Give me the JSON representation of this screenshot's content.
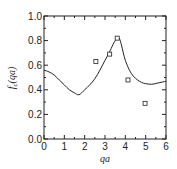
{
  "chart_data": {
    "type": "line",
    "title": "",
    "xlabel": "qa",
    "ylabel": "f_c(qa)",
    "xlim": [
      0,
      6
    ],
    "ylim": [
      0.0,
      1.0
    ],
    "x_ticks": [
      "0",
      "1",
      "2",
      "3",
      "4",
      "5",
      "6"
    ],
    "y_ticks": [
      "0.0",
      "0.2",
      "0.4",
      "0.6",
      "0.8",
      "1.0"
    ],
    "grid": false,
    "legend": null,
    "series": [
      {
        "name": "theory",
        "style": "solid-line",
        "x": [
          0.0,
          0.25,
          0.5,
          0.75,
          1.0,
          1.25,
          1.5,
          1.72,
          2.0,
          2.25,
          2.5,
          2.75,
          3.0,
          3.2,
          3.4,
          3.5,
          3.6,
          3.7,
          3.8,
          3.9,
          4.0,
          4.2,
          4.4,
          4.6,
          4.8,
          5.0,
          5.3,
          5.6,
          6.0
        ],
        "y": [
          0.56,
          0.545,
          0.52,
          0.48,
          0.44,
          0.4,
          0.375,
          0.36,
          0.4,
          0.44,
          0.49,
          0.56,
          0.64,
          0.7,
          0.77,
          0.8,
          0.83,
          0.82,
          0.77,
          0.7,
          0.64,
          0.56,
          0.51,
          0.48,
          0.46,
          0.45,
          0.445,
          0.455,
          0.47
        ]
      },
      {
        "name": "experiment",
        "style": "open-square-markers",
        "x": [
          2.55,
          3.23,
          3.6,
          4.13,
          4.97
        ],
        "y": [
          0.63,
          0.69,
          0.82,
          0.48,
          0.29
        ]
      }
    ]
  }
}
